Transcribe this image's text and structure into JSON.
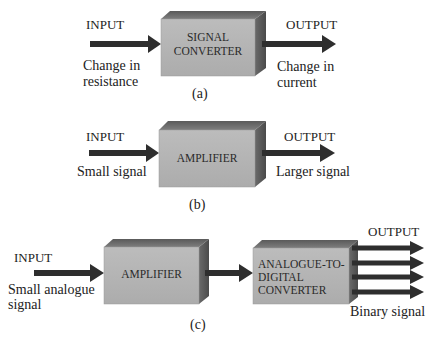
{
  "colors": {
    "front_face": "#b4b4b4",
    "top_face": "#6e6e6e",
    "side_face": "#5a5a5a",
    "arrow": "#2e2e2e",
    "text": "#222222"
  },
  "diagrams": [
    {
      "id": "a",
      "caption": "(a)",
      "input": {
        "label": "INPUT",
        "description_line1": "Change in",
        "description_line2": "resistance"
      },
      "blocks": [
        {
          "label_line1": "SIGNAL",
          "label_line2": "CONVERTER"
        }
      ],
      "output": {
        "label": "OUTPUT",
        "description_line1": "Change in",
        "description_line2": "current"
      }
    },
    {
      "id": "b",
      "caption": "(b)",
      "input": {
        "label": "INPUT",
        "description": "Small signal"
      },
      "blocks": [
        {
          "label": "AMPLIFIER"
        }
      ],
      "output": {
        "label": "OUTPUT",
        "description": "Larger signal"
      }
    },
    {
      "id": "c",
      "caption": "(c)",
      "input": {
        "label": "INPUT",
        "description_line1": "Small analogue",
        "description_line2": "signal"
      },
      "blocks": [
        {
          "label": "AMPLIFIER"
        },
        {
          "label_line1": "ANALOGUE-TO-",
          "label_line2": "DIGITAL",
          "label_line3": "CONVERTER"
        }
      ],
      "output": {
        "label": "OUTPUT",
        "description": "Binary signal",
        "parallel_lines": 4
      }
    }
  ]
}
